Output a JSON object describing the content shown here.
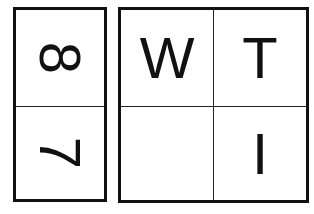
{
  "left_panel": {
    "cells": [
      {
        "label": "8",
        "rotation": "90deg"
      },
      {
        "label": "7",
        "rotation": "90deg"
      }
    ]
  },
  "right_panel": {
    "cells": [
      {
        "label": "W"
      },
      {
        "label": "T"
      },
      {
        "label": ""
      },
      {
        "label": "I"
      }
    ]
  },
  "colors": {
    "line": "#111111",
    "background": "#ffffff"
  }
}
